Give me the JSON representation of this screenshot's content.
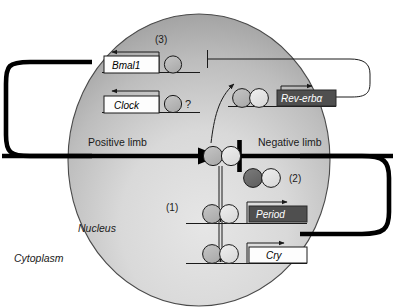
{
  "figure": {
    "compartments": {
      "nucleus_label": "Nucleus",
      "cytoplasm_label": "Cytoplasm"
    },
    "limbs": {
      "positive": "Positive limb",
      "negative": "Negative limb"
    },
    "genes": [
      {
        "id": "bmal1",
        "label": "Bmal1",
        "style": "light"
      },
      {
        "id": "clock",
        "label": "Clock",
        "style": "light"
      },
      {
        "id": "reverba",
        "label": "Rev-erbα",
        "style": "dark"
      },
      {
        "id": "period",
        "label": "Period",
        "style": "dark"
      },
      {
        "id": "cry",
        "label": "Cry",
        "style": "light"
      }
    ],
    "annotations": [
      {
        "id": "step1",
        "label": "(1)"
      },
      {
        "id": "step2",
        "label": "(2)"
      },
      {
        "id": "step3",
        "label": "(3)"
      },
      {
        "id": "unknown",
        "label": "?"
      }
    ],
    "colors": {
      "nucleus_light": "#e0e0e0",
      "nucleus_dark": "#9a9a9a",
      "protein_dark": "#6f6f6f",
      "protein_mid": "#b9b9b9",
      "protein_light": "#e4e4e4",
      "box_dark": "#4f4f4f",
      "box_light": "#fdfdfd",
      "stroke": "#1a1a1a"
    }
  }
}
